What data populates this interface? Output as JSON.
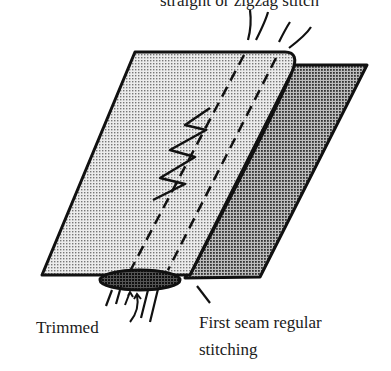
{
  "labels": {
    "top": "straight or zigzag stitch",
    "trimmed": "Trimmed",
    "first_seam_line1": "First seam regular",
    "first_seam_line2": "stitching"
  },
  "colors": {
    "ink": "#111111",
    "front_fabric": "#d4d4d4",
    "back_fabric": "#8a8a8a",
    "seam_allowance": "#3a3a3a"
  }
}
